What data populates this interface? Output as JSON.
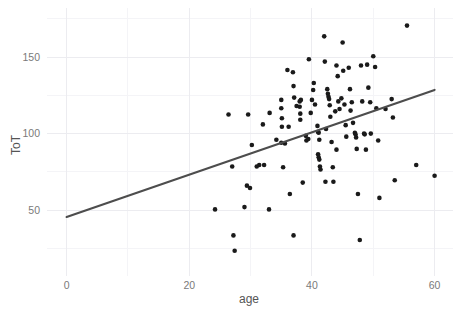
{
  "chart_data": {
    "type": "scatter",
    "title": "",
    "xlabel": "age",
    "ylabel": "ToT",
    "xlim": [
      -3.2,
      63.0
    ],
    "ylim": [
      7.0,
      182.0
    ],
    "grid": true,
    "legend": null,
    "x_ticks": [
      0,
      20,
      40,
      60
    ],
    "x_tick_labels": [
      "0",
      "20",
      "40",
      "60"
    ],
    "y_ticks": [
      50,
      100,
      150
    ],
    "y_tick_labels": [
      "50",
      "100",
      "150"
    ],
    "x_minor_ticks": [
      10,
      30,
      50
    ],
    "y_minor_ticks": [
      25,
      75,
      125,
      175
    ],
    "point_color": "#1a1a1a",
    "point_radius": 2.3,
    "fit_line": {
      "type": "linear",
      "color": "#4d4d4d",
      "x_start": 0,
      "y_start": 45.5,
      "x_end": 60,
      "y_end": 128.5,
      "slope": 1.383,
      "intercept": 45.5
    },
    "points": [
      [
        26.4,
        112.5
      ],
      [
        29.6,
        112.5
      ],
      [
        33.1,
        113.5
      ],
      [
        32.0,
        106.0
      ],
      [
        35.0,
        122.0
      ],
      [
        35.0,
        116.5
      ],
      [
        35.1,
        110.0
      ],
      [
        35.1,
        104.5
      ],
      [
        36.0,
        141.5
      ],
      [
        36.9,
        140.0
      ],
      [
        37.0,
        131.0
      ],
      [
        37.1,
        123.5
      ],
      [
        38.0,
        121.0
      ],
      [
        38.0,
        117.5
      ],
      [
        38.1,
        113.0
      ],
      [
        38.1,
        109.0
      ],
      [
        38.2,
        122.0
      ],
      [
        39.0,
        98.5
      ],
      [
        39.1,
        95.5
      ],
      [
        39.5,
        148.5
      ],
      [
        40.0,
        122.0
      ],
      [
        40.2,
        128.5
      ],
      [
        40.5,
        119.0
      ],
      [
        40.9,
        105.0
      ],
      [
        41.0,
        101.0
      ],
      [
        41.1,
        100.5
      ],
      [
        41.2,
        96.0
      ],
      [
        41.0,
        86.5
      ],
      [
        41.1,
        84.5
      ],
      [
        41.2,
        83.0
      ],
      [
        41.3,
        78.5
      ],
      [
        41.4,
        76.5
      ],
      [
        42.0,
        163.5
      ],
      [
        42.1,
        147.0
      ],
      [
        42.5,
        129.0
      ],
      [
        42.6,
        126.0
      ],
      [
        42.7,
        124.0
      ],
      [
        42.8,
        122.5
      ],
      [
        42.9,
        118.5
      ],
      [
        43.0,
        111.0
      ],
      [
        43.2,
        94.5
      ],
      [
        43.4,
        78.0
      ],
      [
        43.5,
        68.5
      ],
      [
        44.0,
        144.5
      ],
      [
        44.2,
        137.5
      ],
      [
        44.3,
        121.0
      ],
      [
        44.5,
        116.0
      ],
      [
        45.0,
        159.5
      ],
      [
        45.1,
        141.0
      ],
      [
        45.3,
        119.0
      ],
      [
        45.5,
        105.5
      ],
      [
        45.6,
        98.0
      ],
      [
        46.0,
        143.0
      ],
      [
        46.2,
        129.0
      ],
      [
        46.5,
        120.5
      ],
      [
        46.7,
        107.0
      ],
      [
        47.0,
        100.5
      ],
      [
        47.1,
        99.5
      ],
      [
        47.2,
        97.5
      ],
      [
        47.3,
        90.0
      ],
      [
        47.5,
        60.5
      ],
      [
        47.8,
        30.5
      ],
      [
        48.0,
        144.5
      ],
      [
        48.2,
        121.0
      ],
      [
        48.5,
        100.0
      ],
      [
        48.6,
        99.5
      ],
      [
        48.8,
        89.5
      ],
      [
        49.0,
        145.0
      ],
      [
        49.2,
        130.0
      ],
      [
        49.5,
        120.5
      ],
      [
        49.6,
        100.0
      ],
      [
        50.0,
        150.5
      ],
      [
        50.3,
        143.5
      ],
      [
        50.5,
        116.5
      ],
      [
        50.8,
        95.5
      ],
      [
        51.0,
        58.0
      ],
      [
        52.0,
        116.0
      ],
      [
        53.0,
        122.5
      ],
      [
        53.2,
        110.5
      ],
      [
        53.5,
        69.5
      ],
      [
        55.5,
        170.5
      ],
      [
        57.0,
        79.5
      ],
      [
        60.0,
        72.5
      ],
      [
        24.2,
        50.5
      ],
      [
        27.0,
        78.5
      ],
      [
        27.2,
        33.5
      ],
      [
        27.4,
        23.5
      ],
      [
        29.0,
        52.0
      ],
      [
        29.4,
        66.0
      ],
      [
        29.9,
        64.5
      ],
      [
        30.2,
        92.5
      ],
      [
        31.4,
        79.5
      ],
      [
        32.2,
        79.5
      ],
      [
        33.0,
        50.5
      ],
      [
        35.3,
        78.0
      ],
      [
        35.6,
        93.5
      ],
      [
        36.4,
        60.5
      ],
      [
        37.0,
        33.5
      ],
      [
        38.5,
        68.0
      ],
      [
        39.4,
        96.5
      ],
      [
        42.2,
        68.5
      ],
      [
        35.0,
        94.0
      ],
      [
        37.5,
        118.0
      ],
      [
        39.8,
        113.5
      ],
      [
        43.8,
        114.5
      ],
      [
        40.3,
        133.0
      ],
      [
        44.8,
        123.0
      ],
      [
        46.3,
        115.0
      ],
      [
        42.3,
        103.0
      ],
      [
        44.0,
        89.5
      ],
      [
        36.2,
        104.5
      ],
      [
        34.2,
        96.0
      ],
      [
        31.0,
        78.5
      ]
    ]
  }
}
